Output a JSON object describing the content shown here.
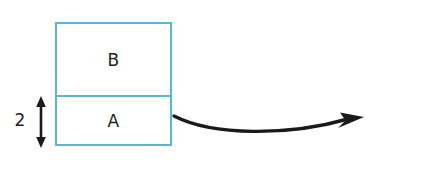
{
  "diagram": {
    "colors": {
      "outline": "#58b6d6",
      "dashed": "#58b6d6",
      "text": "#231f20",
      "arrow": "#1a1a1a",
      "background": "#ffffff"
    },
    "left_figure": {
      "name": "left-stack",
      "blocks": [
        {
          "id": "B",
          "label": "B",
          "position": "top"
        },
        {
          "id": "A",
          "label": "A",
          "position": "bottom"
        }
      ]
    },
    "dimension": {
      "label": "2",
      "measures": "A",
      "arrow_type": "double-headed-vertical"
    },
    "right_figure": {
      "name": "right-stack",
      "blocks": [
        {
          "id": "B",
          "label": "B",
          "position": "left"
        },
        {
          "id": "A",
          "label": "A",
          "position": "right-top"
        },
        {
          "id": "C",
          "label": "C",
          "position": "right-bottom"
        }
      ]
    },
    "transfer_arrow": {
      "label": "",
      "direction": "left-to-right",
      "style": "curved-solid-with-arrowhead"
    }
  }
}
